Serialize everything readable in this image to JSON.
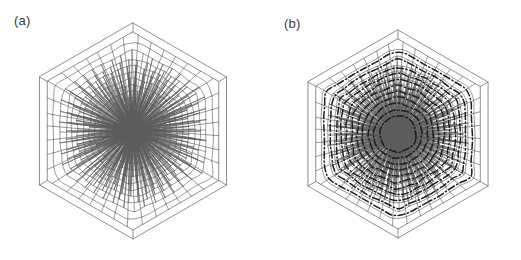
{
  "figure": {
    "type": "scientific-figure",
    "background_color": "#ffffff",
    "width": 521,
    "height": 260,
    "panels": [
      {
        "id": "a",
        "label": "(a)",
        "label_position": {
          "x": 14,
          "y": 14
        },
        "origin_x": 0,
        "has_contour_overlay": false,
        "geometry": {
          "center_x": 133,
          "center_y": 131,
          "outer_radius": 108,
          "rim_offset": 9,
          "rotation_deg": 0,
          "ring_count": 13,
          "innermost_cell_radius": 7.5,
          "cell_line_color": "#5d5d5d",
          "cell_line_width": 0.62,
          "frame_line_color": "#6a6a6a",
          "frame_line_width": 0.75,
          "spiral_twist_deg": 5.5
        }
      },
      {
        "id": "b",
        "label": "(b)",
        "label_position": {
          "x": 23,
          "y": 17
        },
        "origin_x": 261,
        "has_contour_overlay": true,
        "geometry": {
          "center_x": 137,
          "center_y": 134,
          "outer_radius": 104,
          "rim_offset": 9,
          "rotation_deg": 0,
          "ring_count": 13,
          "innermost_cell_radius": 7.5,
          "cell_line_color": "#5d5d5d",
          "cell_line_width": 0.62,
          "frame_line_color": "#6a6a6a",
          "frame_line_width": 0.75,
          "spiral_twist_deg": 5.5
        },
        "contour": {
          "style": "dash-dot",
          "dash_array": "7,2.6,1.2,2.6",
          "color": "#1d1d1d",
          "line_width": 1.5,
          "ring_count": 11,
          "description": "Bold dash-dot closed curves tracing concentric cell rings"
        }
      }
    ],
    "ring_cell_counts": [
      6,
      12,
      18,
      24,
      30,
      34,
      38,
      42,
      44,
      46,
      46,
      44,
      40
    ],
    "ring_radii_fraction": [
      0.07,
      0.135,
      0.2,
      0.266,
      0.333,
      0.4,
      0.468,
      0.536,
      0.604,
      0.672,
      0.74,
      0.82,
      0.915
    ]
  },
  "colors": {
    "background": "#ffffff",
    "cell_stroke": "#5d5d5d",
    "frame_stroke": "#6a6a6a",
    "contour_stroke": "#1d1d1d",
    "label_text": "#3b3b3b"
  }
}
